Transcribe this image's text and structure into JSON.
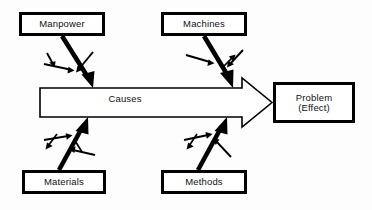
{
  "diagram": {
    "type": "ishikawa-fishbone",
    "background_color": "#fdfdfd",
    "line_color": "#000000",
    "fill_color": "#ffffff",
    "spine": {
      "label": "Causes",
      "arrow_direction": "right",
      "style": "outlined-block-arrow"
    },
    "effect": {
      "line1": "Problem",
      "line2": "(Effect)"
    },
    "categories": [
      {
        "id": "manpower",
        "label": "Manpower",
        "position": "top-left",
        "bone_direction": "down-right",
        "sub_bones": 3
      },
      {
        "id": "machines",
        "label": "Machines",
        "position": "top-right",
        "bone_direction": "down-right",
        "sub_bones": 3
      },
      {
        "id": "materials",
        "label": "Materials",
        "position": "bottom-left",
        "bone_direction": "up-right",
        "sub_bones": 3
      },
      {
        "id": "methods",
        "label": "Methods",
        "position": "bottom-right",
        "bone_direction": "up-right",
        "sub_bones": 3
      }
    ]
  }
}
